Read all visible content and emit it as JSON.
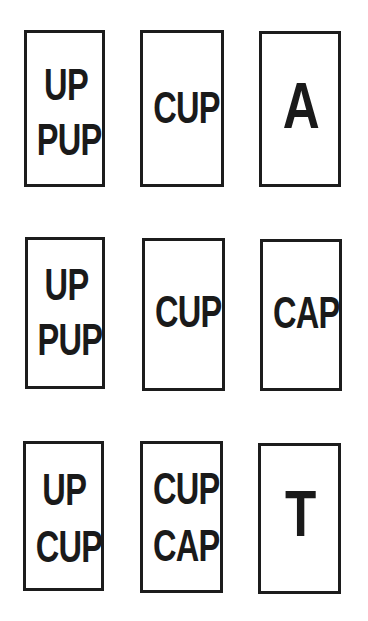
{
  "puzzle": {
    "rows": [
      {
        "cards": [
          {
            "lines": [
              "UP",
              "PUP"
            ]
          },
          {
            "lines": [
              "CUP"
            ]
          },
          {
            "lines": [
              "A"
            ]
          }
        ]
      },
      {
        "cards": [
          {
            "lines": [
              "UP",
              "PUP"
            ]
          },
          {
            "lines": [
              "CUP"
            ]
          },
          {
            "lines": [
              "CAP"
            ]
          }
        ]
      },
      {
        "cards": [
          {
            "lines": [
              "UP",
              "CUP"
            ]
          },
          {
            "lines": [
              "CUP",
              "CAP"
            ]
          },
          {
            "lines": [
              "T"
            ]
          }
        ]
      }
    ]
  },
  "colors": {
    "ink": "#1a1a1a",
    "border": "#1c1c1c",
    "background": "#ffffff"
  }
}
